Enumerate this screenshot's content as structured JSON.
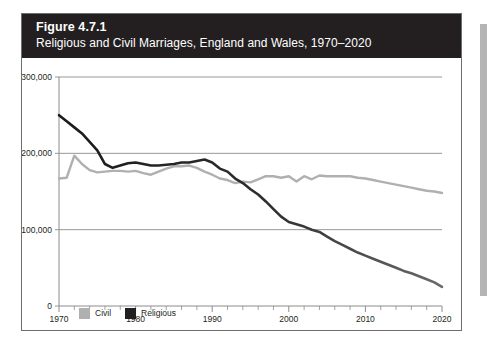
{
  "figure": {
    "number": "Figure 4.7.1",
    "subtitle": "Religious and Civil Marriages, England and Wales, 1970–2020"
  },
  "colors": {
    "title_bar": "#231f20",
    "panel_border": "#6e6e6e",
    "civil": "#b0b0b0",
    "religious": "#1a1a1a",
    "religious_late": "#6a6a6a",
    "gridline": "#8c8c8c",
    "axis": "#8c8c8c",
    "page_edge": "#b4b4b4"
  },
  "legend": {
    "position": "bottom-left",
    "items": [
      {
        "label": "Civil",
        "color": "#b0b0b0"
      },
      {
        "label": "Religious",
        "color": "#231f20"
      }
    ]
  },
  "chart_data": {
    "type": "line",
    "title": "Religious and Civil Marriages, England and Wales, 1970–2020",
    "xlabel": "",
    "ylabel": "",
    "xlim": [
      1970,
      2020
    ],
    "ylim": [
      0,
      300000
    ],
    "xticks": [
      1970,
      1980,
      1990,
      2000,
      2010,
      2020
    ],
    "xtick_labels": [
      "1970",
      "1980",
      "1990",
      "2000",
      "2010",
      "2020"
    ],
    "minor_xtick_interval": 2,
    "yticks": [
      0,
      100000,
      200000,
      300000
    ],
    "ytick_labels": [
      "0",
      "100,000",
      "200,000",
      "300,000"
    ],
    "grid": "horizontal",
    "legend_position": "bottom-left",
    "x": [
      1970,
      1971,
      1972,
      1973,
      1974,
      1975,
      1976,
      1977,
      1978,
      1979,
      1980,
      1981,
      1982,
      1983,
      1984,
      1985,
      1986,
      1987,
      1988,
      1989,
      1990,
      1991,
      1992,
      1993,
      1994,
      1995,
      1996,
      1997,
      1998,
      1999,
      2000,
      2001,
      2002,
      2003,
      2004,
      2005,
      2006,
      2007,
      2008,
      2009,
      2010,
      2011,
      2012,
      2013,
      2014,
      2015,
      2016,
      2017,
      2018,
      2019,
      2020
    ],
    "series": [
      {
        "name": "Civil",
        "color": "#b0b0b0",
        "values": [
          167000,
          168000,
          197000,
          186000,
          178000,
          175000,
          176000,
          177000,
          177000,
          176000,
          177000,
          174000,
          172000,
          176000,
          180000,
          183000,
          183000,
          184000,
          181000,
          176000,
          172000,
          167000,
          165000,
          161000,
          163000,
          162000,
          166000,
          170000,
          170000,
          168000,
          170000,
          163000,
          170000,
          166000,
          171000,
          170000,
          170000,
          170000,
          170000,
          168000,
          167000,
          165000,
          163000,
          161000,
          159000,
          157000,
          155000,
          153000,
          151000,
          150000,
          148000
        ]
      },
      {
        "name": "Religious",
        "color": "#231f20",
        "values": [
          250000,
          242000,
          234000,
          226000,
          215000,
          204000,
          186000,
          181000,
          184000,
          187000,
          188000,
          186000,
          184000,
          184000,
          185000,
          186000,
          188000,
          188000,
          190000,
          192000,
          188000,
          180000,
          176000,
          167000,
          161000,
          153000,
          146000,
          137000,
          127000,
          117000,
          110000,
          107000,
          104000,
          100000,
          97000,
          91000,
          85000,
          80000,
          75000,
          70000,
          66000,
          62000,
          58000,
          54000,
          50000,
          46000,
          43000,
          39000,
          35000,
          31000,
          25000
        ]
      }
    ]
  }
}
